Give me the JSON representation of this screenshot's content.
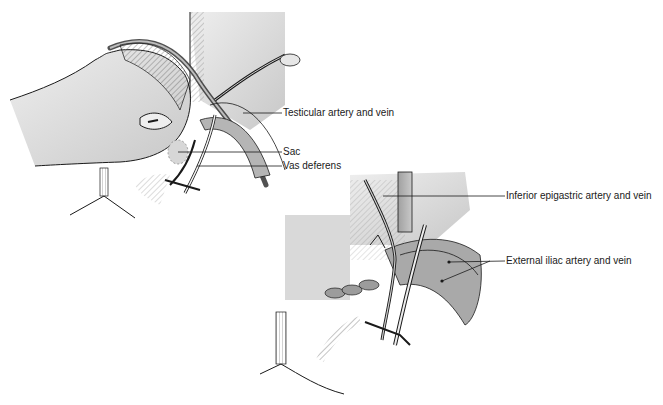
{
  "figure": {
    "panels": [
      {
        "id": "upper-left",
        "description": "Hand retracting tissue with hemostat; sac being dissected near spermatic cord",
        "labels": [
          {
            "text": "Testicular artery and vein",
            "x": 283,
            "y": 108
          },
          {
            "text": "Sac",
            "x": 283,
            "y": 147
          },
          {
            "text": "Vas deferens",
            "x": 283,
            "y": 161
          }
        ]
      },
      {
        "id": "lower-right",
        "description": "Repair view showing sutured tissue and vessels",
        "labels": [
          {
            "text": "Inferior epigastric artery and vein",
            "x": 506,
            "y": 191
          },
          {
            "text": "External iliac artery and vein",
            "x": 506,
            "y": 256
          }
        ]
      }
    ],
    "colors": {
      "line": "#1a1a1a",
      "tissue_light": "#d8d8d8",
      "tissue_mid": "#b5b5b5",
      "tissue_dark": "#8c8c8c",
      "background": "#ffffff"
    }
  }
}
